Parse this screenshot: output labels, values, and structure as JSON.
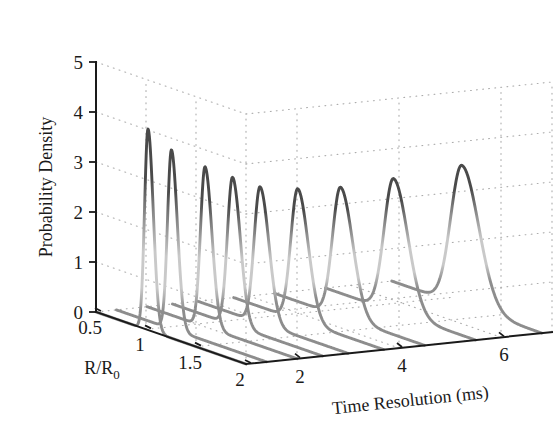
{
  "figure": {
    "background_color": "#ffffff",
    "line_color_dark": "#4a4a4a",
    "line_color_mid": "#8d8d8d",
    "line_color_light": "#c9c9c9",
    "axis_color": "#1a1a1a",
    "grid_color": "#a8a8a8",
    "grid_style": "dotted"
  },
  "chart_data": {
    "type": "line",
    "title": "",
    "subtitle": "",
    "projection": "3d-waterfall",
    "grid": true,
    "legend": null,
    "legend_position": "none",
    "ylabel": "Probability Density",
    "ylim": [
      0,
      5
    ],
    "yticks": [
      0,
      1,
      2,
      3,
      4,
      5
    ],
    "yticklabels": [
      "0",
      "1",
      "2",
      "3",
      "4",
      "5"
    ],
    "xlabel": "R/R_0",
    "xlabel_display": "R/R₀",
    "xlim": [
      0.5,
      2
    ],
    "xticks": [
      0.5,
      1,
      1.5,
      2
    ],
    "xticklabels": [
      "0.5",
      "1",
      "1.5",
      "2"
    ],
    "zlabel": "Time Resolution (ms)",
    "zlim": [
      1,
      7
    ],
    "zticks": [
      2,
      4,
      6
    ],
    "zticklabels": [
      "2",
      "4",
      "6"
    ],
    "series_count": 9,
    "series": [
      {
        "name": "t = 1.0 ms",
        "time_resolution": 1.0,
        "peak_x": 1.02,
        "peak_y": 4.02,
        "width": 0.055,
        "baseline_start": 0.5
      },
      {
        "name": "t = 1.4 ms",
        "time_resolution": 1.4,
        "peak_x": 1.05,
        "peak_y": 3.58,
        "width": 0.062,
        "baseline_start": 0.5
      },
      {
        "name": "t = 2.0 ms",
        "time_resolution": 2.0,
        "peak_x": 1.08,
        "peak_y": 3.2,
        "width": 0.072,
        "baseline_start": 0.5
      },
      {
        "name": "t = 2.5 ms",
        "time_resolution": 2.5,
        "peak_x": 1.1,
        "peak_y": 2.95,
        "width": 0.082,
        "baseline_start": 0.5
      },
      {
        "name": "t = 3.0 ms",
        "time_resolution": 3.0,
        "peak_x": 1.12,
        "peak_y": 2.72,
        "width": 0.094,
        "baseline_start": 0.5
      },
      {
        "name": "t = 3.7 ms",
        "time_resolution": 3.7,
        "peak_x": 1.14,
        "peak_y": 2.62,
        "width": 0.11,
        "baseline_start": 0.5
      },
      {
        "name": "t = 4.5 ms",
        "time_resolution": 4.5,
        "peak_x": 1.16,
        "peak_y": 2.58,
        "width": 0.128,
        "baseline_start": 0.5
      },
      {
        "name": "t = 5.5 ms",
        "time_resolution": 5.5,
        "peak_x": 1.18,
        "peak_y": 2.66,
        "width": 0.15,
        "baseline_start": 0.5
      },
      {
        "name": "t = 6.8 ms",
        "time_resolution": 6.8,
        "peak_x": 1.2,
        "peak_y": 2.8,
        "width": 0.178,
        "baseline_start": 0.5
      }
    ]
  }
}
